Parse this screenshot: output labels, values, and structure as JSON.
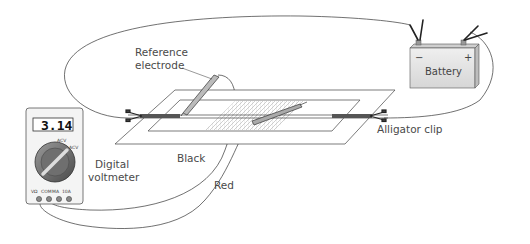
{
  "diagram": {
    "labels": {
      "reference_electrode_line1": "Reference",
      "reference_electrode_line2": "electrode",
      "alligator_clip": "Alligator clip",
      "black_wire": "Black",
      "red_wire": "Red",
      "digital_voltmeter_line1": "Digital",
      "digital_voltmeter_line2": "voltmeter"
    },
    "voltmeter": {
      "reading": "3.14",
      "dial_labels": [
        "ACV",
        "ACV"
      ],
      "ports": [
        "VΩ",
        "COM",
        "MA",
        "10A"
      ]
    },
    "battery": {
      "label": "Battery",
      "negative": "−",
      "positive": "+"
    },
    "colors": {
      "line": "#333333",
      "text": "#4a4a4a",
      "battery_fill": "#e6e6e6",
      "meter_fill": "#f4f4f4",
      "knob_fill": "#777777"
    }
  }
}
